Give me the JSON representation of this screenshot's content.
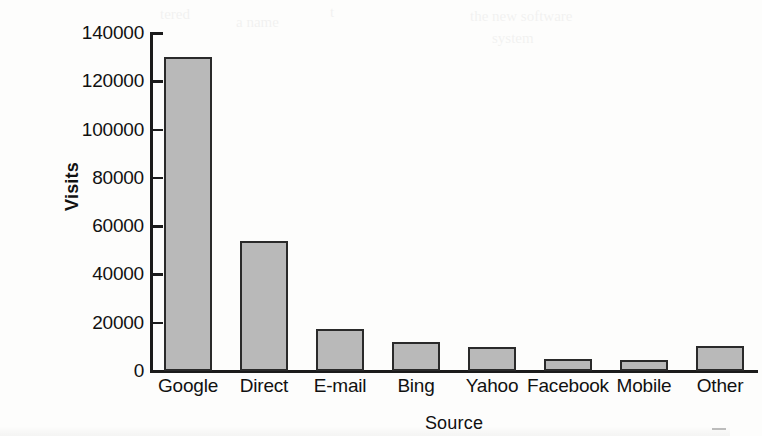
{
  "chart_data": {
    "type": "bar",
    "title": "",
    "xlabel": "Source",
    "ylabel": "Visits",
    "categories": [
      "Google",
      "Direct",
      "E-mail",
      "Bing",
      "Yahoo",
      "Facebook",
      "Mobile",
      "Other"
    ],
    "values": [
      130000,
      54000,
      17500,
      12000,
      10000,
      5000,
      4500,
      10500
    ],
    "ylim": [
      0,
      140000
    ],
    "ytick_labels": [
      "140000",
      "120000",
      "100000",
      "80000",
      "60000",
      "40000",
      "20000",
      "0"
    ],
    "ytick_values": [
      140000,
      120000,
      100000,
      80000,
      60000,
      40000,
      20000,
      0
    ],
    "grid": false,
    "legend": false,
    "bar_fill_color": "#b9b9b9",
    "bar_edge_color": "#2a2a2a",
    "axis_color": "#1b1b1b",
    "background_color": "#fdfdfc"
  },
  "bleed_text": {
    "line1": "tered",
    "line2": "a name",
    "line3": "t",
    "line4": "the new software",
    "line5": "system"
  }
}
